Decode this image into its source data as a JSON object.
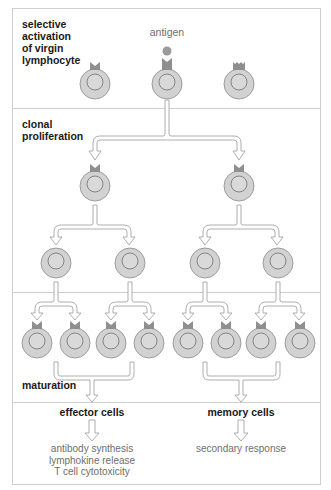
{
  "labels": {
    "stage1": [
      "selective",
      "activation",
      "of virgin",
      "lymphocyte"
    ],
    "stage2": [
      "clonal",
      "proliferation"
    ],
    "stage3": "maturation",
    "antigen": "antigen"
  },
  "outcomes": {
    "effector": {
      "title": "effector cells",
      "results": [
        "antibody synthesis",
        "lymphokine release",
        "T cell cytotoxicity"
      ]
    },
    "memory": {
      "title": "memory cells",
      "results": [
        "secondary response"
      ]
    }
  },
  "colors": {
    "cell_fill": "#d2d2d2",
    "cell_stroke": "#8a8a8a",
    "receptor": "#8f8f8f",
    "frame": "#c8c8c8",
    "arrow_stroke": "#9a9a9a"
  }
}
